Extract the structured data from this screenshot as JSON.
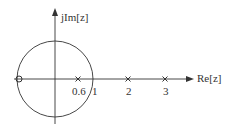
{
  "diagram": {
    "type": "pole-zero plot",
    "axes": {
      "x_label": "Re[z]",
      "y_label": "jIm[z]"
    },
    "unit_circle": {
      "radius": 1
    },
    "zeros": [
      {
        "re": -1,
        "im": 0
      }
    ],
    "poles": [
      {
        "re": 0.6,
        "im": 0
      },
      {
        "re": 2,
        "im": 0
      },
      {
        "re": 3,
        "im": 0
      }
    ],
    "tick_labels": [
      "0.6",
      "1",
      "2",
      "3"
    ]
  }
}
